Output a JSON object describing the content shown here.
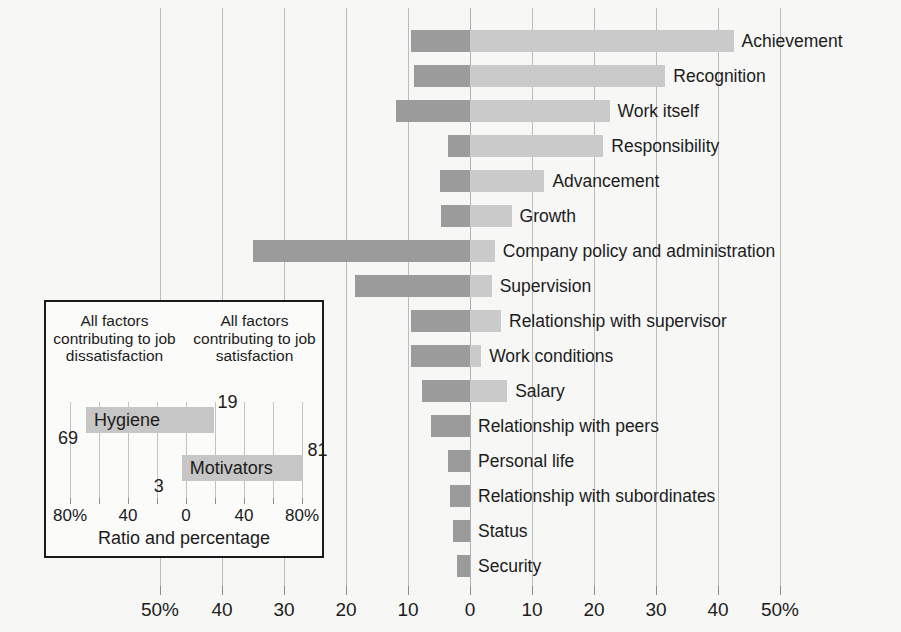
{
  "chart_data": {
    "type": "bar",
    "title": "",
    "subtitle": "",
    "xlabel": "Ratio and percentage",
    "ylabel": "",
    "orientation": "horizontal",
    "style": "diverging-stacked",
    "grid": true,
    "legend_position": "inset-lower-left",
    "xlim": [
      -50,
      50
    ],
    "x_tick_values": [
      -50,
      -40,
      -30,
      -20,
      -10,
      0,
      10,
      20,
      30,
      40,
      50
    ],
    "x_tick_labels": [
      "50%",
      "40",
      "30",
      "20",
      "10",
      "0",
      "10",
      "20",
      "30",
      "40",
      "50%"
    ],
    "left_axis_meaning": "Frequency of factors leading to extreme dissatisfaction (percent)",
    "right_axis_meaning": "Frequency of factors leading to extreme satisfaction (percent)",
    "series": [
      {
        "name": "Hygiene (dissatisfaction contribution)",
        "color": "#9b9b9b"
      },
      {
        "name": "Motivators (satisfaction contribution)",
        "color": "#cacaca"
      }
    ],
    "categories": [
      "Achievement",
      "Recognition",
      "Work itself",
      "Responsibility",
      "Advancement",
      "Growth",
      "Company policy and administration",
      "Supervision",
      "Relationship with supervisor",
      "Work conditions",
      "Salary",
      "Relationship with peers",
      "Personal life",
      "Relationship with subordinates",
      "Status",
      "Security"
    ],
    "bars": [
      {
        "label": "Achievement",
        "dissatisfaction": 9.5,
        "satisfaction": 42.5
      },
      {
        "label": "Recognition",
        "dissatisfaction": 9.0,
        "satisfaction": 31.5
      },
      {
        "label": "Work itself",
        "dissatisfaction": 12.0,
        "satisfaction": 22.5
      },
      {
        "label": "Responsibility",
        "dissatisfaction": 3.5,
        "satisfaction": 21.5
      },
      {
        "label": "Advancement",
        "dissatisfaction": 4.8,
        "satisfaction": 12.0
      },
      {
        "label": "Growth",
        "dissatisfaction": 4.7,
        "satisfaction": 6.7
      },
      {
        "label": "Company policy and administration",
        "dissatisfaction": 35.0,
        "satisfaction": 4.0
      },
      {
        "label": "Supervision",
        "dissatisfaction": 18.5,
        "satisfaction": 3.5
      },
      {
        "label": "Relationship with supervisor",
        "dissatisfaction": 9.5,
        "satisfaction": 5.0
      },
      {
        "label": "Work conditions",
        "dissatisfaction": 9.5,
        "satisfaction": 1.8
      },
      {
        "label": "Salary",
        "dissatisfaction": 7.8,
        "satisfaction": 6.0
      },
      {
        "label": "Relationship with peers",
        "dissatisfaction": 6.3,
        "satisfaction": 0
      },
      {
        "label": "Personal life",
        "dissatisfaction": 3.5,
        "satisfaction": 0
      },
      {
        "label": "Relationship with subordinates",
        "dissatisfaction": 3.2,
        "satisfaction": 0
      },
      {
        "label": "Status",
        "dissatisfaction": 2.7,
        "satisfaction": 0
      },
      {
        "label": "Security",
        "dissatisfaction": 2.1,
        "satisfaction": 0
      }
    ]
  },
  "inset": {
    "caption_left": "All factors contributing to job dissatisfaction",
    "caption_right": "All factors contributing to job satisfaction",
    "axis_title": "Ratio and percentage",
    "tick_values": [
      -80,
      -60,
      -40,
      -20,
      0,
      20,
      40,
      60,
      80
    ],
    "tick_labels": [
      {
        "value": -80,
        "text": "80%"
      },
      {
        "value": -40,
        "text": "40"
      },
      {
        "value": 0,
        "text": "0"
      },
      {
        "value": 40,
        "text": "40"
      },
      {
        "value": 80,
        "text": "80%"
      }
    ],
    "xlim": [
      -90,
      90
    ],
    "bars": [
      {
        "name": "Hygiene",
        "left_value": 69,
        "right_value": 19,
        "left_label": "69",
        "right_label": "19"
      },
      {
        "name": "Motivators",
        "left_value": 3,
        "right_value": 81,
        "left_label": "3",
        "right_label": "81"
      }
    ]
  },
  "colors": {
    "background": "#f7f7f6",
    "hygiene_bar": "#9b9b9b",
    "motivator_bar": "#cacaca",
    "inset_bar": "#c6c6c6",
    "gridline": "#bcbcbc",
    "text": "#1c1c1c",
    "legend_border": "#1a1a1a"
  }
}
